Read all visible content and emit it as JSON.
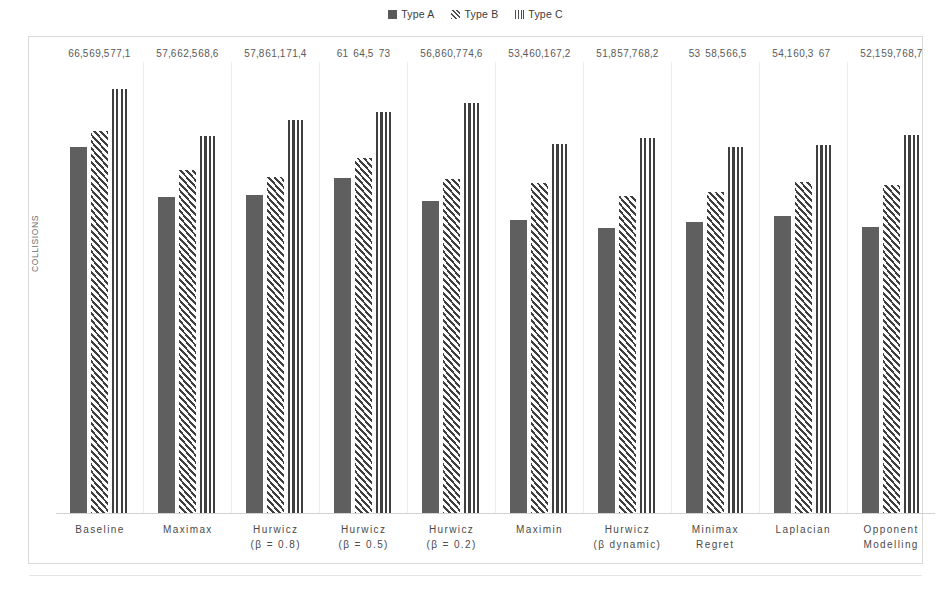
{
  "chart_data": {
    "type": "bar",
    "title": "",
    "xlabel": "",
    "ylabel": "COLLISIONS",
    "ylim": [
      0,
      82
    ],
    "grid": false,
    "legend_position": "top-center",
    "decimal_separator": ",",
    "categories": [
      {
        "line1": "Baseline",
        "line2": ""
      },
      {
        "line1": "Maximax",
        "line2": ""
      },
      {
        "line1": "Hurwicz",
        "line2": "(β = 0.8)"
      },
      {
        "line1": "Hurwicz",
        "line2": "(β = 0.5)"
      },
      {
        "line1": "Hurwicz",
        "line2": "(β = 0.2)"
      },
      {
        "line1": "Maximin",
        "line2": ""
      },
      {
        "line1": "Hurwicz",
        "line2": "(β dynamic)"
      },
      {
        "line1": "Minimax",
        "line2": "Regret"
      },
      {
        "line1": "Laplacian",
        "line2": ""
      },
      {
        "line1": "Opponent",
        "line2": "Modelling"
      }
    ],
    "series": [
      {
        "name": "Type A",
        "pattern": "solid",
        "color": "#5f5f5f",
        "values": [
          66.5,
          57.6,
          57.8,
          61,
          56.8,
          53.4,
          51.8,
          53,
          54.1,
          52.1
        ],
        "labels": [
          "66,5",
          "57,6",
          "57,8",
          "61",
          "56,8",
          "53,4",
          "51,8",
          "53",
          "54,1",
          "52,1"
        ]
      },
      {
        "name": "Type B",
        "pattern": "diagonal-hatch",
        "color": "#3f3f3f",
        "values": [
          69.5,
          62.5,
          61.1,
          64.5,
          60.7,
          60.1,
          57.7,
          58.5,
          60.3,
          59.7
        ],
        "labels": [
          "69,5",
          "62,5",
          "61,1",
          "64,5",
          "60,7",
          "60,1",
          "57,7",
          "58,5",
          "60,3",
          "59,7"
        ]
      },
      {
        "name": "Type C",
        "pattern": "vertical-lines",
        "color": "#3f3f3f",
        "values": [
          77.1,
          68.6,
          71.4,
          73,
          74.6,
          67.2,
          68.2,
          66.5,
          67,
          68.7
        ],
        "labels": [
          "77,1",
          "68,6",
          "71,4",
          "73",
          "74,6",
          "67,2",
          "68,2",
          "66,5",
          "67",
          "68,7"
        ]
      }
    ]
  },
  "legend": {
    "items": [
      {
        "label": "Type A"
      },
      {
        "label": "Type B"
      },
      {
        "label": "Type C"
      }
    ]
  },
  "axis": {
    "y_label": "COLLISIONS"
  }
}
